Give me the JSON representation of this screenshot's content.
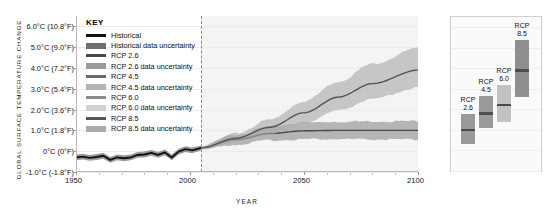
{
  "chart_data": {
    "type": "line",
    "title": "",
    "xlabel": "YEAR",
    "ylabel": "GLOBAL SURFACE TEMPERATURE CHANGE",
    "xlim": [
      1950,
      2100
    ],
    "ylim": [
      -1.0,
      6.5
    ],
    "grid": true,
    "legend_position": "inside-top-left",
    "x_ticks": [
      {
        "value": 1950,
        "label": "1950"
      },
      {
        "value": 2000,
        "label": "2000"
      },
      {
        "value": 2050,
        "label": "2050"
      },
      {
        "value": 2100,
        "label": "2100"
      }
    ],
    "y_ticks": [
      {
        "value": 6.0,
        "label": "6.0°C  (10.8°F)"
      },
      {
        "value": 5.0,
        "label": "5.0°C  (9.0°F)"
      },
      {
        "value": 4.0,
        "label": "4.0°C  (7.2°F)"
      },
      {
        "value": 3.0,
        "label": "3.0°C  (5.4°F)"
      },
      {
        "value": 2.0,
        "label": "2.0°C  (3.6°F)"
      },
      {
        "value": 1.0,
        "label": "1.0°C  (1.8°F)"
      },
      {
        "value": 0.0,
        "label": "0°C  (0°F)"
      },
      {
        "value": -1.0,
        "label": "-1.0°C  (-1.8°F)"
      }
    ],
    "projection_start_year": 2005,
    "series": [
      {
        "name": "Historical",
        "color": "#111111",
        "band_color": "#7a7a7a",
        "x": [
          1950,
          1953,
          1956,
          1959,
          1962,
          1965,
          1968,
          1971,
          1974,
          1977,
          1980,
          1983,
          1986,
          1989,
          1992,
          1995,
          1998,
          2001,
          2005
        ],
        "values": [
          -0.3,
          -0.26,
          -0.32,
          -0.28,
          -0.22,
          -0.42,
          -0.3,
          -0.34,
          -0.3,
          -0.18,
          -0.16,
          -0.08,
          -0.18,
          -0.06,
          -0.3,
          -0.02,
          0.1,
          0.04,
          0.16
        ],
        "band_lower": [
          -0.44,
          -0.4,
          -0.46,
          -0.42,
          -0.36,
          -0.56,
          -0.44,
          -0.48,
          -0.44,
          -0.32,
          -0.3,
          -0.22,
          -0.32,
          -0.2,
          -0.44,
          -0.16,
          -0.04,
          -0.1,
          0.04
        ],
        "band_upper": [
          -0.16,
          -0.12,
          -0.18,
          -0.14,
          -0.08,
          -0.28,
          -0.16,
          -0.2,
          -0.16,
          -0.04,
          -0.02,
          0.06,
          -0.04,
          0.08,
          -0.16,
          0.12,
          0.24,
          0.18,
          0.28
        ]
      },
      {
        "name": "RCP 2.6",
        "color": "#4a4a4a",
        "band_color": "#8e8e8e",
        "x": [
          2005,
          2020,
          2035,
          2050,
          2065,
          2080,
          2100
        ],
        "values": [
          0.16,
          0.55,
          0.85,
          0.98,
          1.0,
          1.0,
          1.0
        ],
        "band_lower": [
          0.1,
          0.32,
          0.52,
          0.58,
          0.58,
          0.56,
          0.55
        ],
        "band_upper": [
          0.24,
          0.8,
          1.18,
          1.38,
          1.42,
          1.44,
          1.45
        ]
      },
      {
        "name": "RCP 8.5",
        "color": "#555555",
        "band_color": "#a9a9a9",
        "x": [
          2005,
          2020,
          2035,
          2050,
          2065,
          2080,
          2100
        ],
        "values": [
          0.16,
          0.62,
          1.15,
          1.85,
          2.6,
          3.25,
          3.9
        ],
        "band_lower": [
          0.1,
          0.44,
          0.82,
          1.35,
          1.95,
          2.5,
          3.05
        ],
        "band_upper": [
          0.24,
          0.84,
          1.52,
          2.4,
          3.35,
          4.2,
          4.95
        ]
      }
    ],
    "end_bars": {
      "panel_label": "",
      "ylim": [
        -1.0,
        6.5
      ],
      "bars": [
        {
          "name": "RCP 2.6",
          "label_line1": "RCP",
          "label_line2": "2.6",
          "low": 0.3,
          "high": 1.8,
          "mean": 1.0,
          "color": "#9a9a9a"
        },
        {
          "name": "RCP 4.5",
          "label_line1": "RCP",
          "label_line2": "4.5",
          "low": 1.1,
          "high": 2.65,
          "mean": 1.8,
          "color": "#9a9a9a"
        },
        {
          "name": "RCP 6.0",
          "label_line1": "RCP",
          "label_line2": "6.0",
          "low": 1.4,
          "high": 3.2,
          "mean": 2.2,
          "color": "#c2c2c2"
        },
        {
          "name": "RCP 8.5",
          "label_line1": "RCP",
          "label_line2": "8.5",
          "low": 2.6,
          "high": 5.4,
          "mean": 3.9,
          "color": "#8f8f8f"
        }
      ]
    }
  },
  "legend": {
    "title": "KEY",
    "items": [
      {
        "label": "Historical",
        "type": "line",
        "color": "#111111"
      },
      {
        "label": "Historical data uncertainty",
        "type": "band",
        "color": "#6e6e6e"
      },
      {
        "label": "RCP 2.6",
        "type": "line",
        "color": "#4a4a4a"
      },
      {
        "label": "RCP 2.6 data uncertainty",
        "type": "band",
        "color": "#9b9b9b"
      },
      {
        "label": "RCP 4.5",
        "type": "line",
        "color": "#6a6a6a"
      },
      {
        "label": "RCP 4.5 data uncertainty",
        "type": "band",
        "color": "#b4b4b4"
      },
      {
        "label": "RCP 6.0",
        "type": "line",
        "color": "#8c8c8c"
      },
      {
        "label": "RCP 6.0 data uncertainty",
        "type": "band",
        "color": "#d2d2d2"
      },
      {
        "label": "RCP 8.5",
        "type": "line",
        "color": "#555555"
      },
      {
        "label": "RCP 8.5 data uncertainty",
        "type": "band",
        "color": "#a9a9a9"
      }
    ]
  }
}
